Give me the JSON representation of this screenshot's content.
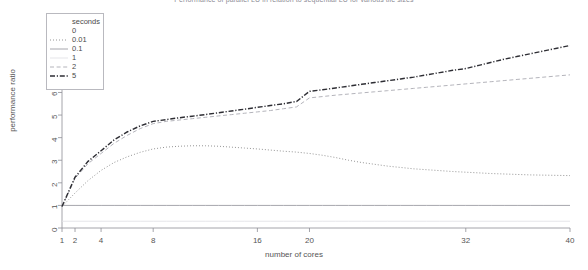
{
  "chart_data": {
    "type": "line",
    "title": "Performance of parallel LU in relation to sequential LU for various tile sizes",
    "xlabel": "number of cores",
    "ylabel": "performance ratio",
    "xlim": [
      1,
      40
    ],
    "ylim": [
      0,
      8.5
    ],
    "xticks": [
      1,
      2,
      4,
      8,
      16,
      20,
      32,
      40
    ],
    "yticks": [
      0,
      1,
      2,
      3,
      4,
      5,
      6,
      7,
      8
    ],
    "grid": false,
    "legend_title": "seconds",
    "legend_position": "top-left",
    "x": [
      1,
      2,
      3,
      4,
      5,
      6,
      7,
      8,
      9,
      10,
      11,
      12,
      13,
      14,
      15,
      16,
      17,
      18,
      19,
      20,
      21,
      22,
      23,
      24,
      25,
      26,
      27,
      28,
      29,
      30,
      31,
      32,
      33,
      34,
      35,
      36,
      37,
      38,
      39,
      40
    ],
    "series": [
      {
        "name": "0",
        "label": "0",
        "style": "blank",
        "color": "#ffffff",
        "values": [
          1.0,
          1.0,
          1.0,
          1.0,
          1.0,
          1.0,
          1.0,
          1.0,
          1.0,
          1.0,
          1.0,
          1.0,
          1.0,
          1.0,
          1.0,
          1.0,
          1.0,
          1.0,
          1.0,
          1.0,
          1.0,
          1.0,
          1.0,
          1.0,
          1.0,
          1.0,
          1.0,
          1.0,
          1.0,
          1.0,
          1.0,
          1.0,
          1.0,
          1.0,
          1.0,
          1.0,
          1.0,
          1.0,
          1.0,
          1.0
        ]
      },
      {
        "name": "0.01",
        "label": "0.01",
        "style": "dotted",
        "color": "#8a8a8a",
        "values": [
          0.95,
          1.55,
          2.1,
          2.55,
          2.9,
          3.15,
          3.35,
          3.5,
          3.58,
          3.62,
          3.64,
          3.64,
          3.62,
          3.58,
          3.54,
          3.5,
          3.45,
          3.4,
          3.36,
          3.3,
          3.22,
          3.12,
          3.0,
          2.9,
          2.82,
          2.74,
          2.68,
          2.62,
          2.58,
          2.54,
          2.5,
          2.47,
          2.44,
          2.41,
          2.39,
          2.37,
          2.35,
          2.34,
          2.33,
          2.32
        ]
      },
      {
        "name": "0.1",
        "label": "0.1",
        "style": "solid",
        "color": "#9c9ca4",
        "values": [
          1.0,
          1.0,
          1.0,
          1.0,
          1.0,
          1.0,
          1.0,
          1.0,
          1.0,
          1.0,
          1.0,
          1.0,
          1.0,
          1.0,
          1.0,
          1.0,
          1.0,
          1.0,
          1.0,
          1.0,
          1.0,
          1.0,
          1.0,
          1.0,
          1.0,
          1.0,
          1.0,
          1.0,
          1.0,
          1.0,
          1.0,
          1.0,
          1.0,
          1.0,
          1.0,
          1.0,
          1.0,
          1.0,
          1.0,
          1.0
        ]
      },
      {
        "name": "1",
        "label": "1",
        "style": "faint-solid",
        "color": "#e2e2e6",
        "values": [
          0.3,
          0.3,
          0.3,
          0.3,
          0.3,
          0.3,
          0.3,
          0.3,
          0.3,
          0.3,
          0.3,
          0.3,
          0.3,
          0.3,
          0.3,
          0.3,
          0.3,
          0.3,
          0.3,
          0.3,
          0.3,
          0.3,
          0.3,
          0.3,
          0.3,
          0.3,
          0.3,
          0.3,
          0.3,
          0.3,
          0.3,
          0.3,
          0.3,
          0.3,
          0.3,
          0.3,
          0.3,
          0.3,
          0.3,
          0.3
        ]
      },
      {
        "name": "2",
        "label": "2",
        "style": "dashed-light",
        "color": "#b4b4bb",
        "values": [
          0.95,
          2.2,
          2.85,
          3.3,
          3.75,
          4.1,
          4.4,
          4.62,
          4.72,
          4.78,
          4.84,
          4.9,
          4.96,
          5.02,
          5.08,
          5.14,
          5.2,
          5.28,
          5.36,
          5.76,
          5.82,
          5.88,
          5.93,
          5.98,
          6.03,
          6.08,
          6.13,
          6.18,
          6.23,
          6.28,
          6.33,
          6.38,
          6.43,
          6.48,
          6.53,
          6.58,
          6.63,
          6.68,
          6.73,
          6.78
        ]
      },
      {
        "name": "5",
        "label": "5",
        "style": "dashdot",
        "color": "#2e2e34",
        "values": [
          0.95,
          2.25,
          2.95,
          3.42,
          3.9,
          4.25,
          4.52,
          4.72,
          4.8,
          4.88,
          4.95,
          5.02,
          5.1,
          5.18,
          5.26,
          5.34,
          5.42,
          5.5,
          5.6,
          6.05,
          6.12,
          6.2,
          6.28,
          6.36,
          6.44,
          6.52,
          6.6,
          6.68,
          6.78,
          6.88,
          6.98,
          7.06,
          7.2,
          7.34,
          7.48,
          7.6,
          7.72,
          7.84,
          7.96,
          8.08
        ]
      }
    ]
  }
}
